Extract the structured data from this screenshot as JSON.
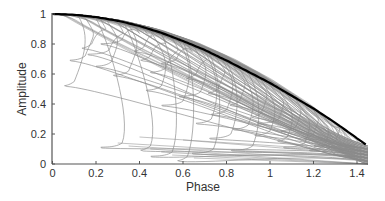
{
  "chart_data": {
    "type": "line",
    "title": "",
    "xlabel": "Phase",
    "ylabel": "Amplitude",
    "xlim": [
      0,
      1.45
    ],
    "ylim": [
      0,
      1
    ],
    "grid": false,
    "legend": null,
    "xticks": [
      0,
      0.2,
      0.4,
      0.6,
      0.8,
      1,
      1.2,
      1.4
    ],
    "xtick_labels": [
      "0",
      "0.2",
      "0.4",
      "0.6",
      "0.8",
      "1",
      "1.2",
      "1.4"
    ],
    "yticks": [
      0,
      0.2,
      0.4,
      0.6,
      0.8,
      1
    ],
    "ytick_labels": [
      "0",
      "0.2",
      "0.4",
      "0.6",
      "0.8",
      "1"
    ],
    "colors": {
      "envelope": "#000000",
      "trajectories": "#8a8a8a",
      "axis": "#555555"
    },
    "envelope": {
      "name": "envelope",
      "x": [
        0,
        0.1,
        0.2,
        0.3,
        0.4,
        0.5,
        0.6,
        0.7,
        0.8,
        0.9,
        1.0,
        1.1,
        1.2,
        1.3,
        1.45
      ],
      "y": [
        1.0,
        0.995,
        0.98,
        0.955,
        0.92,
        0.875,
        0.82,
        0.76,
        0.69,
        0.615,
        0.54,
        0.455,
        0.37,
        0.275,
        0.12
      ]
    },
    "trajectories": [
      {
        "peel_x": 0.12,
        "peel_y": 0.97,
        "curl_x": 0.1,
        "curl_y": 0.55
      },
      {
        "peel_x": 0.15,
        "peel_y": 0.96,
        "curl_x": 0.15,
        "curl_y": 0.72
      },
      {
        "peel_x": 0.2,
        "peel_y": 0.95,
        "curl_x": 0.32,
        "curl_y": 0.14
      },
      {
        "peel_x": 0.22,
        "peel_y": 0.94,
        "curl_x": 0.18,
        "curl_y": 0.8
      },
      {
        "peel_x": 0.25,
        "peel_y": 0.93,
        "curl_x": 0.27,
        "curl_y": 0.68
      },
      {
        "peel_x": 0.3,
        "peel_y": 0.92,
        "curl_x": 0.26,
        "curl_y": 0.76
      },
      {
        "peel_x": 0.33,
        "peel_y": 0.91,
        "curl_x": 0.45,
        "curl_y": 0.12
      },
      {
        "peel_x": 0.35,
        "peel_y": 0.9,
        "curl_x": 0.35,
        "curl_y": 0.62
      },
      {
        "peel_x": 0.38,
        "peel_y": 0.89,
        "curl_x": 0.32,
        "curl_y": 0.83
      },
      {
        "peel_x": 0.42,
        "peel_y": 0.88,
        "curl_x": 0.42,
        "curl_y": 0.78
      },
      {
        "peel_x": 0.45,
        "peel_y": 0.87,
        "curl_x": 0.5,
        "curl_y": 0.52
      },
      {
        "peel_x": 0.5,
        "peel_y": 0.85,
        "curl_x": 0.55,
        "curl_y": 0.08
      },
      {
        "peel_x": 0.5,
        "peel_y": 0.86,
        "curl_x": 0.45,
        "curl_y": 0.72
      },
      {
        "peel_x": 0.55,
        "peel_y": 0.83,
        "curl_x": 0.52,
        "curl_y": 0.64
      },
      {
        "peel_x": 0.58,
        "peel_y": 0.82,
        "curl_x": 0.6,
        "curl_y": 0.42
      },
      {
        "peel_x": 0.6,
        "peel_y": 0.81,
        "curl_x": 0.62,
        "curl_y": 0.05
      },
      {
        "peel_x": 0.62,
        "peel_y": 0.8,
        "curl_x": 0.57,
        "curl_y": 0.7
      },
      {
        "peel_x": 0.65,
        "peel_y": 0.78,
        "curl_x": 0.68,
        "curl_y": 0.48
      },
      {
        "peel_x": 0.68,
        "peel_y": 0.77,
        "curl_x": 0.66,
        "curl_y": 0.6
      },
      {
        "peel_x": 0.7,
        "peel_y": 0.75,
        "curl_x": 0.73,
        "curl_y": 0.3
      },
      {
        "peel_x": 0.72,
        "peel_y": 0.74,
        "curl_x": 0.74,
        "curl_y": 0.1
      },
      {
        "peel_x": 0.75,
        "peel_y": 0.72,
        "curl_x": 0.76,
        "curl_y": 0.5
      },
      {
        "peel_x": 0.78,
        "peel_y": 0.7,
        "curl_x": 0.8,
        "curl_y": 0.36
      },
      {
        "peel_x": 0.8,
        "peel_y": 0.68,
        "curl_x": 0.82,
        "curl_y": 0.2
      },
      {
        "peel_x": 0.83,
        "peel_y": 0.66,
        "curl_x": 0.86,
        "curl_y": 0.42
      },
      {
        "peel_x": 0.86,
        "peel_y": 0.64,
        "curl_x": 0.9,
        "curl_y": 0.26
      },
      {
        "peel_x": 0.9,
        "peel_y": 0.61,
        "curl_x": 0.92,
        "curl_y": 0.12
      },
      {
        "peel_x": 0.93,
        "peel_y": 0.59,
        "curl_x": 0.96,
        "curl_y": 0.34
      },
      {
        "peel_x": 0.96,
        "peel_y": 0.57,
        "curl_x": 1.0,
        "curl_y": 0.22
      },
      {
        "peel_x": 1.0,
        "peel_y": 0.54,
        "curl_x": 1.04,
        "curl_y": 0.3
      },
      {
        "peel_x": 1.04,
        "peel_y": 0.5,
        "curl_x": 1.08,
        "curl_y": 0.18
      },
      {
        "peel_x": 1.08,
        "peel_y": 0.47,
        "curl_x": 1.12,
        "curl_y": 0.25
      },
      {
        "peel_x": 1.12,
        "peel_y": 0.44,
        "curl_x": 1.16,
        "curl_y": 0.14
      },
      {
        "peel_x": 1.16,
        "peel_y": 0.4,
        "curl_x": 1.2,
        "curl_y": 0.2
      },
      {
        "peel_x": 1.2,
        "peel_y": 0.37,
        "curl_x": 1.25,
        "curl_y": 0.12
      },
      {
        "peel_x": 1.25,
        "peel_y": 0.32,
        "curl_x": 1.3,
        "curl_y": 0.15
      }
    ]
  }
}
